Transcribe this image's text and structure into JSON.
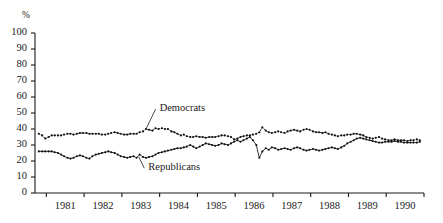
{
  "chart_data": {
    "type": "line",
    "title": "",
    "subtitle": "",
    "xlabel": "",
    "ylabel": "%",
    "ylim": [
      0,
      100
    ],
    "ytick_labels": [
      "100",
      "90",
      "80",
      "70",
      "60",
      "50",
      "40",
      "30",
      "20",
      "10",
      "0"
    ],
    "ytick_values": [
      100,
      90,
      80,
      70,
      60,
      50,
      40,
      30,
      20,
      10,
      0
    ],
    "xtick_labels": [
      "1981",
      "1982",
      "1983",
      "1984",
      "1985",
      "1986",
      "1987",
      "1988",
      "1989",
      "1990"
    ],
    "xlim": [
      1980.6,
      1990.9
    ],
    "grid": false,
    "legend_position": "inline-annotation",
    "annotations": [
      {
        "text": "Democrats",
        "x": 1983.9,
        "y": 50,
        "points_to_x": 1983.55,
        "points_to_y": 40.5
      },
      {
        "text": "Republicans",
        "x": 1983.6,
        "y": 13,
        "points_to_x": 1983.35,
        "points_to_y": 22.5
      }
    ],
    "series": [
      {
        "name": "Democrats",
        "style": "dotted",
        "marker": "dot",
        "x": [
          1980.7,
          1980.79,
          1980.87,
          1980.96,
          1981.04,
          1981.12,
          1981.21,
          1981.29,
          1981.37,
          1981.46,
          1981.54,
          1981.62,
          1981.71,
          1981.79,
          1981.87,
          1981.96,
          1982.04,
          1982.12,
          1982.21,
          1982.29,
          1982.37,
          1982.46,
          1982.54,
          1982.62,
          1982.71,
          1982.79,
          1982.87,
          1982.96,
          1983.04,
          1983.12,
          1983.21,
          1983.29,
          1983.37,
          1983.46,
          1983.54,
          1983.62,
          1983.71,
          1983.79,
          1983.87,
          1983.96,
          1984.04,
          1984.12,
          1984.21,
          1984.29,
          1984.37,
          1984.46,
          1984.54,
          1984.62,
          1984.71,
          1984.79,
          1984.87,
          1984.96,
          1985.04,
          1985.12,
          1985.21,
          1985.29,
          1985.37,
          1985.46,
          1985.54,
          1985.62,
          1985.71,
          1985.79,
          1985.87,
          1985.96,
          1986.04,
          1986.12,
          1986.21,
          1986.29,
          1986.37,
          1986.46,
          1986.54,
          1986.62,
          1986.71,
          1986.79,
          1986.87,
          1986.96,
          1987.04,
          1987.12,
          1987.21,
          1987.29,
          1987.37,
          1987.46,
          1987.54,
          1987.62,
          1987.71,
          1987.79,
          1987.87,
          1987.96,
          1988.04,
          1988.12,
          1988.21,
          1988.29,
          1988.37,
          1988.46,
          1988.54,
          1988.62,
          1988.71,
          1988.79,
          1988.87,
          1988.96,
          1989.04,
          1989.12,
          1989.21,
          1989.29,
          1989.37,
          1989.46,
          1989.54,
          1989.62,
          1989.71,
          1989.79,
          1989.87,
          1989.96,
          1990.04,
          1990.12,
          1990.21,
          1990.29,
          1990.37,
          1990.46,
          1990.54,
          1990.62,
          1990.71,
          1990.79
        ],
        "y": [
          37,
          36,
          34,
          35,
          36,
          36,
          36,
          36,
          36.5,
          37,
          37,
          36.5,
          37,
          37.5,
          37.5,
          37.5,
          37,
          37,
          37,
          37,
          36.5,
          36.5,
          37,
          37.5,
          38,
          37.5,
          37,
          36.5,
          36.5,
          37,
          37,
          37,
          38,
          38.5,
          40,
          39.5,
          39,
          40.5,
          40,
          40.5,
          40,
          40,
          38.5,
          38,
          37,
          36,
          36.5,
          35.5,
          35,
          35,
          35.5,
          35,
          35,
          34.5,
          35,
          35,
          35,
          35.5,
          36,
          36,
          35.5,
          35,
          33.5,
          34,
          35,
          35.5,
          36,
          36,
          36.5,
          37,
          38,
          41,
          39,
          38,
          37.5,
          38,
          38.5,
          38,
          37.5,
          38.5,
          39,
          39.5,
          39,
          38.5,
          39.5,
          40,
          39.5,
          38.5,
          38,
          38,
          37.5,
          38,
          37,
          36.5,
          36,
          35.5,
          36,
          36,
          36.5,
          36.5,
          37,
          37,
          36.5,
          36,
          35,
          34.5,
          34,
          34.5,
          35,
          34,
          33.5,
          33,
          33,
          33.5,
          33,
          33,
          33,
          32.5,
          33,
          33,
          33.5,
          33
        ]
      },
      {
        "name": "Republicans",
        "style": "solid",
        "marker": "dot",
        "x": [
          1980.7,
          1980.79,
          1980.87,
          1980.96,
          1981.04,
          1981.12,
          1981.21,
          1981.29,
          1981.37,
          1981.46,
          1981.54,
          1981.62,
          1981.71,
          1981.79,
          1981.87,
          1981.96,
          1982.04,
          1982.12,
          1982.21,
          1982.29,
          1982.37,
          1982.46,
          1982.54,
          1982.62,
          1982.71,
          1982.79,
          1982.87,
          1982.96,
          1983.04,
          1983.12,
          1983.21,
          1983.29,
          1983.37,
          1983.46,
          1983.54,
          1983.62,
          1983.71,
          1983.79,
          1983.87,
          1983.96,
          1984.04,
          1984.12,
          1984.21,
          1984.29,
          1984.37,
          1984.46,
          1984.54,
          1984.62,
          1984.71,
          1984.79,
          1984.87,
          1984.96,
          1985.04,
          1985.12,
          1985.21,
          1985.29,
          1985.37,
          1985.46,
          1985.54,
          1985.62,
          1985.71,
          1985.79,
          1985.87,
          1985.96,
          1986.04,
          1986.12,
          1986.21,
          1986.29,
          1986.37,
          1986.46,
          1986.54,
          1986.62,
          1986.71,
          1986.79,
          1986.87,
          1986.96,
          1987.04,
          1987.12,
          1987.21,
          1987.29,
          1987.37,
          1987.46,
          1987.54,
          1987.62,
          1987.71,
          1987.79,
          1987.87,
          1987.96,
          1988.04,
          1988.12,
          1988.21,
          1988.29,
          1988.37,
          1988.46,
          1988.54,
          1988.62,
          1988.71,
          1988.79,
          1988.87,
          1988.96,
          1989.04,
          1989.12,
          1989.21,
          1989.29,
          1989.37,
          1989.46,
          1989.54,
          1989.62,
          1989.71,
          1989.79,
          1989.87,
          1989.96,
          1990.04,
          1990.12,
          1990.21,
          1990.29,
          1990.37,
          1990.46,
          1990.54,
          1990.62,
          1990.71,
          1990.79
        ],
        "y": [
          26,
          26,
          26,
          26,
          26,
          25.5,
          25,
          24,
          23,
          22,
          21.5,
          22,
          23,
          23.5,
          23,
          22,
          21.5,
          23,
          24,
          24.5,
          25,
          25.5,
          26,
          25.5,
          25,
          24,
          23,
          22.5,
          22,
          22.5,
          23,
          22,
          24,
          22.5,
          22,
          22.5,
          23,
          24,
          25,
          25.5,
          26,
          26.5,
          27,
          27.5,
          28,
          28,
          28.5,
          29,
          30,
          29,
          28,
          29,
          30,
          31,
          30.5,
          30,
          29.5,
          30,
          31,
          30.5,
          30,
          31,
          32,
          33,
          32,
          33,
          34,
          35,
          33,
          30,
          22,
          26,
          28,
          27,
          28.5,
          28,
          27,
          27.5,
          28,
          27.5,
          27,
          28,
          28.5,
          28,
          27,
          26.5,
          27,
          27.5,
          27,
          26.5,
          27,
          27.5,
          28,
          28.5,
          28,
          27.5,
          28.5,
          29.5,
          31,
          32,
          33,
          34,
          34.5,
          34,
          33.5,
          33,
          32.5,
          32,
          31.5,
          31.5,
          32,
          32,
          32,
          32.5,
          32,
          32,
          31.5,
          31.5,
          31.5,
          31.5,
          31.5,
          32
        ]
      }
    ]
  },
  "axis": {
    "percent_symbol": "%"
  }
}
